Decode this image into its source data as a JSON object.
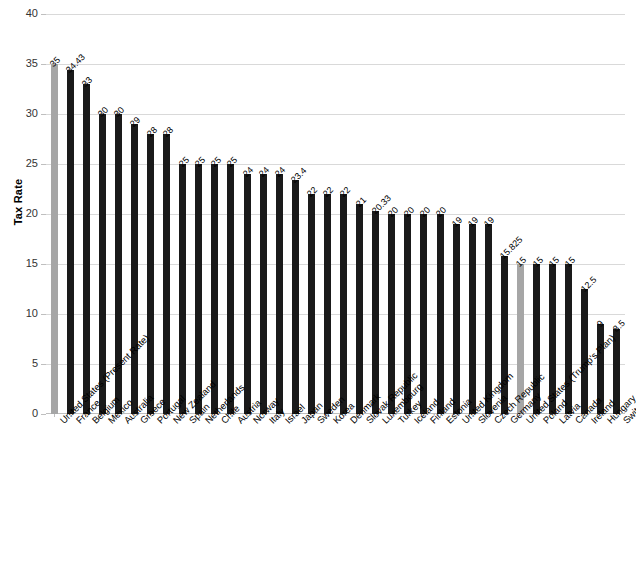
{
  "chart_data": {
    "type": "bar",
    "title": "",
    "xlabel": "",
    "ylabel": "Tax Rate",
    "ylim": [
      0,
      40
    ],
    "ytick_labels": [
      "0",
      "5",
      "10",
      "15",
      "20",
      "25",
      "30",
      "35",
      "40"
    ],
    "ytick_values": [
      0,
      5,
      10,
      15,
      20,
      25,
      30,
      35,
      40
    ],
    "grid": true,
    "legend": "none",
    "highlight_color": "#a6a6a6",
    "bar_color": "#1a1a1a",
    "categories": [
      "United States (Present Rate)",
      "France",
      "Belgium",
      "Mexico",
      "Australia",
      "Greece",
      "Portugal",
      "New Zealand",
      "Spain",
      "Netherlands",
      "Chile",
      "Austria",
      "Norway",
      "Italy",
      "Israel",
      "Japan",
      "Sweden",
      "Korea",
      "Denmark",
      "Slovak Republic",
      "Luxembourg",
      "Turkey",
      "Iceland",
      "Finland",
      "Estonia",
      "United Kingdom",
      "Slovenia",
      "Czech Republic",
      "Germany",
      "United States (Trump's Plan)",
      "Poland",
      "Latvia",
      "Canada",
      "Ireland",
      "Hungary",
      "Switzerland"
    ],
    "values": [
      35,
      34.43,
      33,
      30,
      30,
      29,
      28,
      28,
      25,
      25,
      25,
      25,
      24,
      24,
      24,
      23.4,
      22,
      22,
      22,
      21,
      20.33,
      20,
      20,
      20,
      20,
      19,
      19,
      19,
      15.825,
      15,
      15,
      15,
      15,
      12.5,
      9,
      8.5
    ],
    "value_labels": [
      "35",
      "34.43",
      "33",
      "30",
      "30",
      "29",
      "28",
      "28",
      "25",
      "25",
      "25",
      "25",
      "24",
      "24",
      "24",
      "23.4",
      "22",
      "22",
      "22",
      "21",
      "20.33",
      "20",
      "20",
      "20",
      "20",
      "19",
      "19",
      "19",
      "15.825",
      "15",
      "15",
      "15",
      "15",
      "12.5",
      "9",
      "8.5"
    ],
    "highlighted_indices": [
      0,
      29
    ]
  }
}
